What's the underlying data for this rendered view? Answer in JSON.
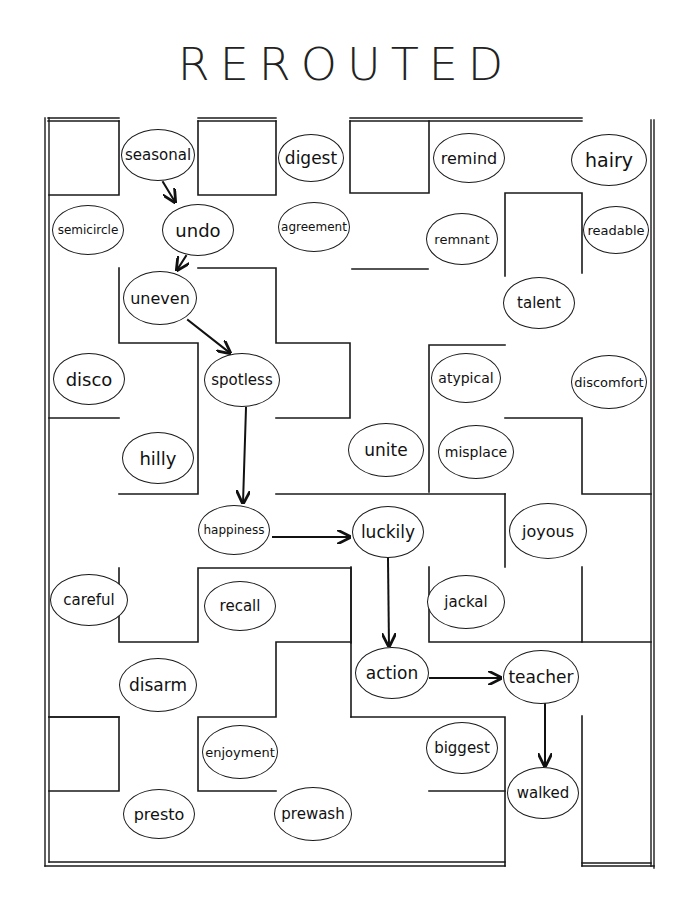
{
  "title": "REROUTED",
  "colors": {
    "ink": "#1a1a1a",
    "paper": "#ffffff"
  },
  "path": [
    "seasonal",
    "undo",
    "uneven",
    "spotless",
    "happiness",
    "luckily",
    "action",
    "teacher",
    "walked"
  ],
  "nodes": [
    {
      "id": "seasonal",
      "label": "seasonal",
      "x": 158,
      "y": 155,
      "w": 74,
      "h": 52,
      "fs": 15
    },
    {
      "id": "digest",
      "label": "digest",
      "x": 311,
      "y": 158,
      "w": 66,
      "h": 48,
      "fs": 17
    },
    {
      "id": "remind",
      "label": "remind",
      "x": 469,
      "y": 158,
      "w": 72,
      "h": 50,
      "fs": 16
    },
    {
      "id": "hairy",
      "label": "hairy",
      "x": 609,
      "y": 160,
      "w": 76,
      "h": 52,
      "fs": 19
    },
    {
      "id": "semicircle",
      "label": "semicircle",
      "x": 88,
      "y": 230,
      "w": 72,
      "h": 50,
      "fs": 12
    },
    {
      "id": "undo",
      "label": "undo",
      "x": 198,
      "y": 230,
      "w": 72,
      "h": 52,
      "fs": 18
    },
    {
      "id": "agreement",
      "label": "agreement",
      "x": 314,
      "y": 227,
      "w": 72,
      "h": 50,
      "fs": 12
    },
    {
      "id": "remnant",
      "label": "remnant",
      "x": 462,
      "y": 239,
      "w": 72,
      "h": 52,
      "fs": 13
    },
    {
      "id": "readable",
      "label": "readable",
      "x": 616,
      "y": 230,
      "w": 66,
      "h": 48,
      "fs": 13
    },
    {
      "id": "uneven",
      "label": "uneven",
      "x": 160,
      "y": 298,
      "w": 74,
      "h": 54,
      "fs": 16
    },
    {
      "id": "talent",
      "label": "talent",
      "x": 539,
      "y": 303,
      "w": 72,
      "h": 52,
      "fs": 15
    },
    {
      "id": "disco",
      "label": "disco",
      "x": 89,
      "y": 379,
      "w": 72,
      "h": 52,
      "fs": 18
    },
    {
      "id": "spotless",
      "label": "spotless",
      "x": 242,
      "y": 380,
      "w": 76,
      "h": 54,
      "fs": 15
    },
    {
      "id": "atypical",
      "label": "atypical",
      "x": 466,
      "y": 378,
      "w": 70,
      "h": 50,
      "fs": 14
    },
    {
      "id": "discomfort",
      "label": "discomfort",
      "x": 609,
      "y": 382,
      "w": 76,
      "h": 54,
      "fs": 13
    },
    {
      "id": "hilly",
      "label": "hilly",
      "x": 158,
      "y": 458,
      "w": 72,
      "h": 52,
      "fs": 18
    },
    {
      "id": "unite",
      "label": "unite",
      "x": 386,
      "y": 450,
      "w": 76,
      "h": 54,
      "fs": 17
    },
    {
      "id": "misplace",
      "label": "misplace",
      "x": 476,
      "y": 452,
      "w": 76,
      "h": 54,
      "fs": 14
    },
    {
      "id": "happiness",
      "label": "happiness",
      "x": 234,
      "y": 530,
      "w": 72,
      "h": 50,
      "fs": 12
    },
    {
      "id": "luckily",
      "label": "luckily",
      "x": 388,
      "y": 532,
      "w": 72,
      "h": 52,
      "fs": 17
    },
    {
      "id": "joyous",
      "label": "joyous",
      "x": 548,
      "y": 531,
      "w": 78,
      "h": 56,
      "fs": 16
    },
    {
      "id": "careful",
      "label": "careful",
      "x": 89,
      "y": 600,
      "w": 78,
      "h": 52,
      "fs": 15
    },
    {
      "id": "recall",
      "label": "recall",
      "x": 240,
      "y": 606,
      "w": 72,
      "h": 50,
      "fs": 15
    },
    {
      "id": "jackal",
      "label": "jackal",
      "x": 466,
      "y": 602,
      "w": 78,
      "h": 54,
      "fs": 15
    },
    {
      "id": "disarm",
      "label": "disarm",
      "x": 158,
      "y": 685,
      "w": 78,
      "h": 54,
      "fs": 17
    },
    {
      "id": "action",
      "label": "action",
      "x": 392,
      "y": 673,
      "w": 74,
      "h": 52,
      "fs": 17
    },
    {
      "id": "teacher",
      "label": "teacher",
      "x": 541,
      "y": 677,
      "w": 76,
      "h": 54,
      "fs": 17
    },
    {
      "id": "enjoyment",
      "label": "enjoyment",
      "x": 240,
      "y": 752,
      "w": 76,
      "h": 54,
      "fs": 13
    },
    {
      "id": "biggest",
      "label": "biggest",
      "x": 462,
      "y": 748,
      "w": 72,
      "h": 52,
      "fs": 15
    },
    {
      "id": "walked",
      "label": "walked",
      "x": 543,
      "y": 793,
      "w": 72,
      "h": 52,
      "fs": 15
    },
    {
      "id": "presto",
      "label": "presto",
      "x": 159,
      "y": 814,
      "w": 72,
      "h": 50,
      "fs": 16
    },
    {
      "id": "prewash",
      "label": "prewash",
      "x": 313,
      "y": 814,
      "w": 78,
      "h": 54,
      "fs": 15
    }
  ]
}
